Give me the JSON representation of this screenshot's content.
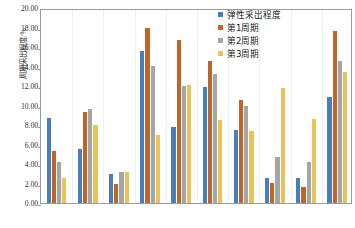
{
  "chart_data": {
    "type": "bar",
    "title": "",
    "xlabel": "",
    "ylabel": "周期采出程度/%",
    "ylim": [
      0,
      20
    ],
    "ytick_step": 2,
    "ytick_labels": [
      "20.00",
      "18.00",
      "16.00",
      "14.00",
      "12.00",
      "10.00",
      "8.00",
      "6.00",
      "4.00",
      "2.00",
      "0.00"
    ],
    "grid": false,
    "legend_position": "top-right",
    "categories": [
      "1",
      "2",
      "3",
      "4",
      "5",
      "6",
      "7",
      "8",
      "9",
      "10"
    ],
    "series": [
      {
        "name": "弹性采出程度",
        "color": "#4A7EBB",
        "values": [
          8.7,
          5.5,
          3.0,
          15.6,
          7.8,
          11.9,
          7.5,
          2.6,
          2.6,
          10.9
        ]
      },
      {
        "name": "第1周期",
        "color": "#C0652A",
        "values": [
          5.3,
          9.3,
          1.9,
          18.0,
          16.7,
          14.6,
          10.6,
          2.1,
          1.6,
          17.6
        ]
      },
      {
        "name": "第2周期",
        "color": "#A5A5A5",
        "values": [
          4.2,
          9.6,
          3.2,
          14.1,
          12.0,
          13.2,
          9.9,
          4.7,
          4.2,
          14.6
        ]
      },
      {
        "name": "第3周期",
        "color": "#E8C35C",
        "values": [
          2.6,
          8.0,
          3.2,
          7.0,
          12.1,
          8.5,
          7.4,
          11.8,
          8.6,
          13.4
        ]
      }
    ]
  },
  "legend": {
    "items": [
      {
        "label": "弹性采出程度",
        "color": "#4A7EBB"
      },
      {
        "label": "第1周期",
        "color": "#C0652A"
      },
      {
        "label": "第2周期",
        "color": "#A5A5A5"
      },
      {
        "label": "第3周期",
        "color": "#E8C35C"
      }
    ]
  },
  "axes": {
    "y_title": "周期采出程度/%",
    "y_max": "20.00",
    "y_min": "0.00"
  }
}
